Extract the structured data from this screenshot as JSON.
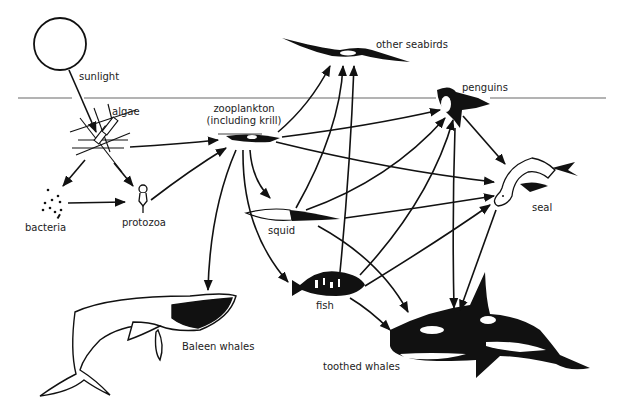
{
  "colors": {
    "ink": "#111111",
    "waterline": "#9a9a9a",
    "background": "#ffffff"
  },
  "nodes": {
    "sunlight": {
      "label": "sunlight"
    },
    "algae": {
      "label": "algae"
    },
    "bacteria": {
      "label": "bacteria"
    },
    "protozoa": {
      "label": "protozoa"
    },
    "zooplankton": {
      "label_line1": "zooplankton",
      "label_line2": "(including krill)"
    },
    "squid": {
      "label": "squid"
    },
    "fish": {
      "label": "fish"
    },
    "other_seabirds": {
      "label": "other seabirds"
    },
    "penguins": {
      "label": "penguins"
    },
    "seal": {
      "label": "seal"
    },
    "baleen_whales": {
      "label": "Baleen whales"
    },
    "toothed_whales": {
      "label": "toothed whales"
    }
  },
  "edges": [
    {
      "from": "sunlight",
      "to": "algae"
    },
    {
      "from": "algae",
      "to": "zooplankton"
    },
    {
      "from": "algae",
      "to": "bacteria"
    },
    {
      "from": "algae",
      "to": "protozoa"
    },
    {
      "from": "bacteria",
      "to": "protozoa"
    },
    {
      "from": "protozoa",
      "to": "zooplankton"
    },
    {
      "from": "zooplankton",
      "to": "other seabirds"
    },
    {
      "from": "zooplankton",
      "to": "penguins"
    },
    {
      "from": "zooplankton",
      "to": "seal"
    },
    {
      "from": "zooplankton",
      "to": "squid"
    },
    {
      "from": "zooplankton",
      "to": "fish"
    },
    {
      "from": "zooplankton",
      "to": "Baleen whales"
    },
    {
      "from": "squid",
      "to": "other seabirds"
    },
    {
      "from": "squid",
      "to": "penguins"
    },
    {
      "from": "squid",
      "to": "seal"
    },
    {
      "from": "squid",
      "to": "toothed whales"
    },
    {
      "from": "fish",
      "to": "other seabirds"
    },
    {
      "from": "fish",
      "to": "penguins"
    },
    {
      "from": "fish",
      "to": "seal"
    },
    {
      "from": "fish",
      "to": "toothed whales"
    },
    {
      "from": "penguins",
      "to": "seal"
    },
    {
      "from": "penguins",
      "to": "toothed whales"
    },
    {
      "from": "seal",
      "to": "toothed whales"
    }
  ]
}
